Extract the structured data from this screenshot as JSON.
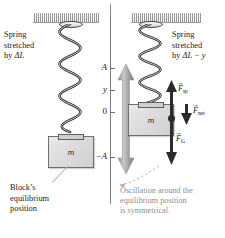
{
  "figure": {
    "type": "physics-diagram",
    "topic": "Mass on a vertical spring — simple harmonic motion"
  },
  "left_panel": {
    "name": "equilibrium-state",
    "spring_label": "Spring\nstretched\nby ΔL",
    "spring_label_line1": "Spring",
    "spring_label_line2": "stretched",
    "spring_label_line3_pre": "by ",
    "spring_label_line3_sym": "ΔL",
    "block_mass_symbol": "m",
    "block_note_line1": "Block’s",
    "block_note_line2": "equilibrium",
    "block_note_line3": "position"
  },
  "right_panel": {
    "name": "displaced-state",
    "spring_label_line1": "Spring",
    "spring_label_line2": "stretched",
    "spring_label_line3_pre": "by ",
    "spring_label_line3_sym": "ΔL − y",
    "block_mass_symbol": "m",
    "forces": [
      {
        "id": "spring-force",
        "symbol": "F",
        "subscript": "sp",
        "direction": "up",
        "arrow": "→"
      },
      {
        "id": "net-force",
        "symbol": "F",
        "subscript": "net",
        "direction": "down",
        "arrow": "→"
      },
      {
        "id": "gravity-force",
        "symbol": "F",
        "subscript": "G",
        "direction": "down",
        "arrow": "→"
      }
    ]
  },
  "axis": {
    "name": "displacement-axis",
    "ticks": [
      {
        "label": "A",
        "value": 1
      },
      {
        "label": "y",
        "value": 0.55
      },
      {
        "label": "0",
        "value": 0
      },
      {
        "label": "−A",
        "value": -1
      }
    ]
  },
  "oscillation_arrow": {
    "name": "oscillation-range-arrow",
    "double_headed": true,
    "color": "#9b9b9b"
  },
  "caption": {
    "line1": "Oscillation around the",
    "line2": "equilibrium position",
    "line3": "is symmetrical.",
    "color": "#8e8e8e"
  },
  "colors": {
    "ink": "#1b1b1b",
    "gray_text": "#8e8e8e",
    "ceiling": "#c6c6c6",
    "block_fill": "#dcdcdc",
    "arrow_gray": "#9b9b9b",
    "vector_black": "#2b2b2b"
  }
}
